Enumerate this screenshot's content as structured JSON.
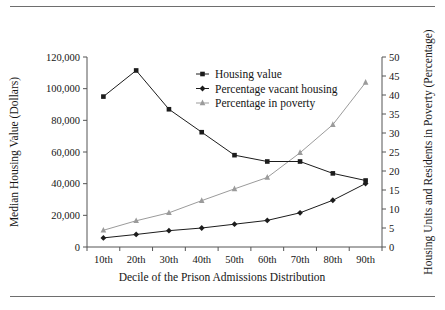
{
  "figure": {
    "top_rule": true,
    "bottom_rule": true,
    "background_color": "#ffffff"
  },
  "chart_data": {
    "type": "line",
    "title": "",
    "xlabel": "Decile of the Prison Admissions Distribution",
    "ylabel": "Median Housing Value (Dollars)",
    "ylabel_right": "Housing Units and Residents in Poverty (Percentage)",
    "categories": [
      "10th",
      "20th",
      "30th",
      "40th",
      "50th",
      "60th",
      "70th",
      "80th",
      "90th"
    ],
    "ylim": [
      0,
      120000
    ],
    "ylim_right": [
      0,
      50
    ],
    "yticks": [
      "0",
      "20,000",
      "40,000",
      "60,000",
      "80,000",
      "100,000",
      "120,000"
    ],
    "ytick_values": [
      0,
      20000,
      40000,
      60000,
      80000,
      100000,
      120000
    ],
    "yticks_right": [
      "0",
      "5",
      "10",
      "15",
      "20",
      "25",
      "30",
      "35",
      "40",
      "45",
      "50"
    ],
    "ytick_values_right": [
      0,
      5,
      10,
      15,
      20,
      25,
      30,
      35,
      40,
      45,
      50
    ],
    "grid": false,
    "legend_position": "upper-center",
    "series": [
      {
        "name": "Housing value",
        "axis": "left",
        "marker": "square",
        "color": "#1c1c1c",
        "values": [
          95000,
          111500,
          87000,
          72500,
          58000,
          54000,
          54000,
          46500,
          42000
        ]
      },
      {
        "name": "Percentage vacant housing",
        "axis": "right",
        "marker": "diamond",
        "color": "#1c1c1c",
        "values": [
          2.4,
          3.3,
          4.3,
          5.0,
          6.0,
          7.0,
          9.0,
          12.3,
          16.7
        ]
      },
      {
        "name": "Percentage in poverty",
        "axis": "right",
        "marker": "triangle",
        "color": "#9b9b9b",
        "values": [
          4.4,
          6.9,
          9.0,
          12.2,
          15.3,
          18.3,
          24.8,
          32.2,
          43.3
        ]
      }
    ]
  }
}
